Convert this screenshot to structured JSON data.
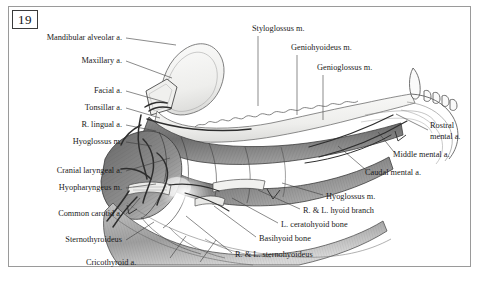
{
  "figure": {
    "number": "19",
    "caption_fragment": ""
  },
  "labels_left": [
    {
      "text": "Mandibular alveolar a.",
      "x": 14,
      "y": 37,
      "w": 108
    },
    {
      "text": "Maxillary a.",
      "x": 14,
      "y": 60,
      "w": 108
    },
    {
      "text": "Facial a.",
      "x": 14,
      "y": 90,
      "w": 108
    },
    {
      "text": "Tonsillar a.",
      "x": 14,
      "y": 107,
      "w": 108
    },
    {
      "text": "R. lingual a.",
      "x": 14,
      "y": 124,
      "w": 108
    },
    {
      "text": "Hyoglossus m.",
      "x": 14,
      "y": 141,
      "w": 108
    },
    {
      "text": "Cranial laryngeal a.",
      "x": 4,
      "y": 170,
      "w": 118
    },
    {
      "text": "Hyopharyngeus m.",
      "x": 4,
      "y": 187,
      "w": 118
    },
    {
      "text": "Common carotid a.",
      "x": 4,
      "y": 213,
      "w": 118
    },
    {
      "text": "Sternothyroideus",
      "x": 4,
      "y": 239,
      "w": 118
    }
  ],
  "labels_bottom_left": [
    {
      "text": "Cricothyroid a.",
      "x": 86,
      "y": 262,
      "w": 80
    }
  ],
  "labels_top": [
    {
      "text": "Styloglossus m.",
      "x": 252,
      "y": 28
    },
    {
      "text": "Geniohyoideus m.",
      "x": 291,
      "y": 47
    },
    {
      "text": "Genioglossus m.",
      "x": 317,
      "y": 67
    }
  ],
  "labels_right": [
    {
      "text": "Rostral",
      "x": 430,
      "y": 125
    },
    {
      "text": "mental a.",
      "x": 430,
      "y": 136
    },
    {
      "text": "Middle mental a.",
      "x": 397,
      "y": 154
    },
    {
      "text": "Caudal mental a.",
      "x": 369,
      "y": 172
    }
  ],
  "labels_bottom_right": [
    {
      "text": "Hyoglossus m.",
      "x": 326,
      "y": 197
    },
    {
      "text": "R. & L. hyoid branch",
      "x": 303,
      "y": 211
    },
    {
      "text": "L. ceratohyoid bone",
      "x": 281,
      "y": 225
    },
    {
      "text": "Basihyoid bone",
      "x": 259,
      "y": 239
    },
    {
      "text": "R. & L. sternohyoideus",
      "x": 235,
      "y": 255
    }
  ],
  "colors": {
    "frame_border": "#9a9a9a",
    "text": "#1a1a1a",
    "leader_line": "#4a4a4a",
    "muscle_dark": "#6f6f6f",
    "muscle_mid": "#9b9b9b",
    "muscle_light": "#c9c9c9",
    "bone_light": "#f2f2f0",
    "vessel": "#3a3a3a"
  },
  "illustration": {
    "description": "Lateral view of canine mandible, tongue and hyoid musculature with arterial supply",
    "regions": [
      "mandible bone",
      "tongue musculature",
      "hyoid apparatus",
      "larynx",
      "teeth arcade"
    ]
  }
}
